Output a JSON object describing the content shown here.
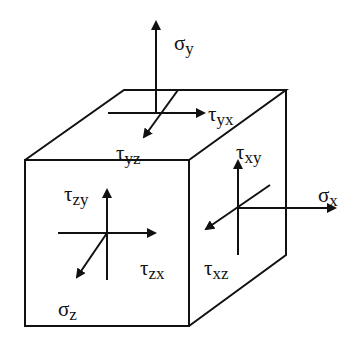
{
  "diagram": {
    "stroke_color": "#111111",
    "background": "#ffffff"
  },
  "labels": {
    "sigma_y": {
      "symbol": "σ",
      "sub": "y"
    },
    "tau_yx": {
      "symbol": "τ",
      "sub": "yx"
    },
    "tau_yz": {
      "symbol": "τ",
      "sub": "yz"
    },
    "tau_xy": {
      "symbol": "τ",
      "sub": "xy"
    },
    "sigma_x": {
      "symbol": "σ",
      "sub": "x"
    },
    "tau_xz": {
      "symbol": "τ",
      "sub": "xz"
    },
    "tau_zy": {
      "symbol": "τ",
      "sub": "zy"
    },
    "tau_zx": {
      "symbol": "τ",
      "sub": "zx"
    },
    "sigma_z": {
      "symbol": "σ",
      "sub": "z"
    }
  }
}
